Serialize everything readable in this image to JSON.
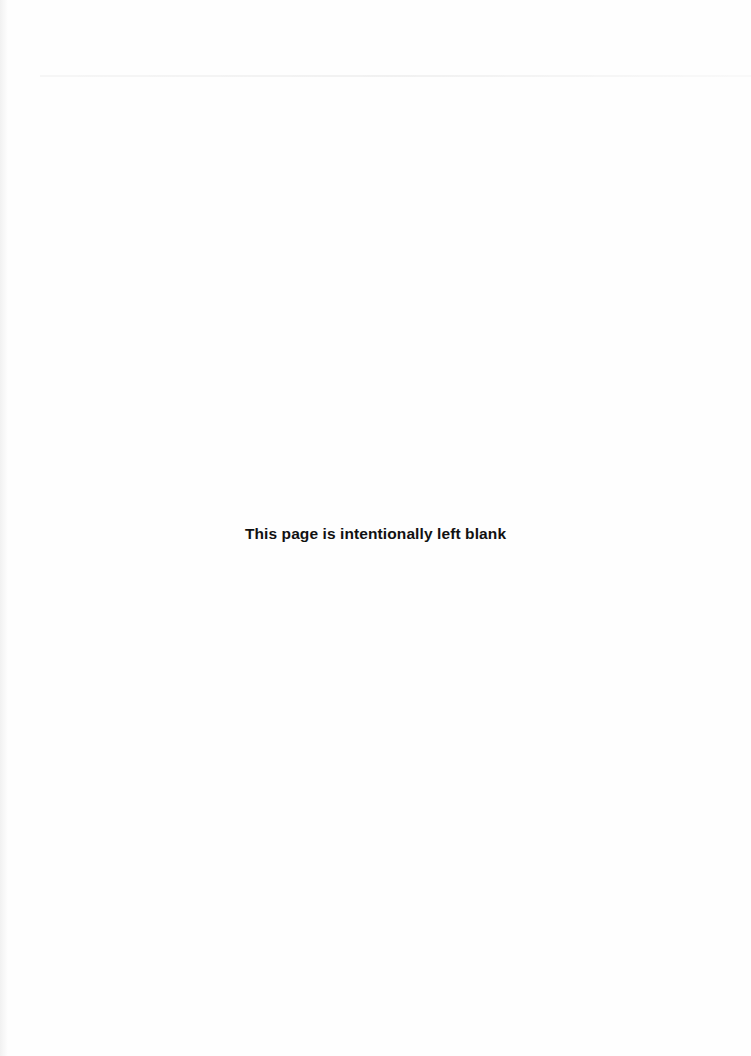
{
  "page": {
    "notice": "This page is intentionally left blank"
  }
}
